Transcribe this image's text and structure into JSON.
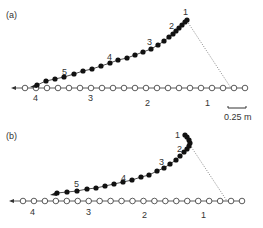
{
  "figure": {
    "panel_a": {
      "label": "(a)",
      "open_row": {
        "y": 88,
        "x_start": 25,
        "x_end": 245,
        "count": 21,
        "labels": [
          {
            "text": "4",
            "x": 33,
            "y": 101
          },
          {
            "text": "3",
            "x": 88,
            "y": 101
          },
          {
            "text": "2",
            "x": 145,
            "y": 106
          },
          {
            "text": "1",
            "x": 205,
            "y": 106
          }
        ]
      },
      "filled_curve": {
        "points": [
          [
            37,
            85
          ],
          [
            46,
            81
          ],
          [
            55,
            79
          ],
          [
            64,
            77
          ],
          [
            74,
            74
          ],
          [
            83,
            71
          ],
          [
            92,
            69
          ],
          [
            101,
            66
          ],
          [
            110,
            63
          ],
          [
            118,
            60
          ],
          [
            127,
            58
          ],
          [
            135,
            55
          ],
          [
            143,
            52
          ],
          [
            151,
            49
          ],
          [
            158,
            45
          ],
          [
            164,
            41
          ],
          [
            169,
            37
          ],
          [
            173,
            34
          ],
          [
            176,
            31
          ],
          [
            179,
            28
          ],
          [
            182,
            25
          ],
          [
            185,
            22
          ],
          [
            187,
            20
          ]
        ],
        "labels": [
          {
            "text": "1",
            "x": 183,
            "y": 15
          },
          {
            "text": "2",
            "x": 169,
            "y": 29
          },
          {
            "text": "3",
            "x": 147,
            "y": 45
          },
          {
            "text": "4",
            "x": 107,
            "y": 60
          },
          {
            "text": "5",
            "x": 62,
            "y": 75
          }
        ]
      },
      "dotted_line": {
        "x1": 187,
        "y1": 21,
        "x2": 231,
        "y2": 88
      },
      "scale_bar": {
        "x1": 228,
        "x2": 246,
        "y": 108,
        "label": "0.25 m"
      }
    },
    "panel_b": {
      "label": "(b)",
      "open_row": {
        "y": 201,
        "x_start": 23,
        "x_end": 242,
        "count": 21,
        "labels": [
          {
            "text": "4",
            "x": 30,
            "y": 215
          },
          {
            "text": "3",
            "x": 86,
            "y": 215
          },
          {
            "text": "2",
            "x": 142,
            "y": 218
          },
          {
            "text": "1",
            "x": 201,
            "y": 218
          }
        ]
      },
      "filled_curve": {
        "points": [
          [
            57,
            193
          ],
          [
            67,
            192
          ],
          [
            77,
            191
          ],
          [
            87,
            189
          ],
          [
            96,
            188
          ],
          [
            105,
            186
          ],
          [
            114,
            184
          ],
          [
            123,
            182
          ],
          [
            132,
            180
          ],
          [
            141,
            177
          ],
          [
            149,
            175
          ],
          [
            157,
            171
          ],
          [
            164,
            168
          ],
          [
            170,
            164
          ],
          [
            176,
            160
          ],
          [
            180,
            156
          ],
          [
            184,
            152
          ],
          [
            187,
            149
          ],
          [
            189,
            146
          ],
          [
            190,
            143
          ],
          [
            189,
            140
          ],
          [
            187,
            137
          ],
          [
            185,
            135
          ]
        ],
        "labels": [
          {
            "text": "1",
            "x": 175,
            "y": 138
          },
          {
            "text": "2",
            "x": 177,
            "y": 152
          },
          {
            "text": "3",
            "x": 159,
            "y": 165
          },
          {
            "text": "4",
            "x": 121,
            "y": 181
          },
          {
            "text": "5",
            "x": 74,
            "y": 187
          }
        ]
      },
      "dotted_line": {
        "x1": 190,
        "y1": 145,
        "x2": 227,
        "y2": 201
      }
    }
  }
}
